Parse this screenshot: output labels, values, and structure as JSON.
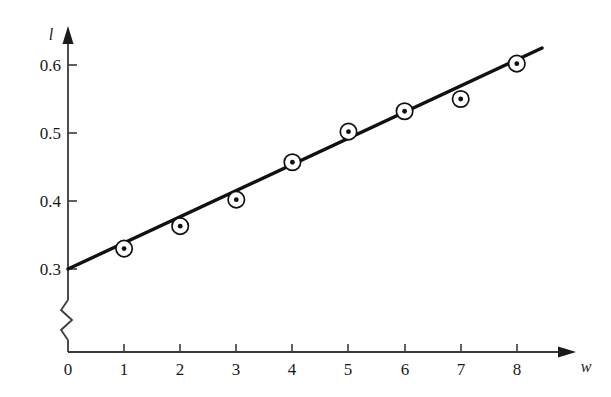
{
  "chart_data": {
    "type": "scatter",
    "title": "",
    "subtitle": "",
    "xlabel": "w",
    "ylabel": "l",
    "x": [
      1,
      2,
      3,
      4,
      5,
      6,
      7,
      8
    ],
    "values": [
      0.33,
      0.363,
      0.402,
      0.457,
      0.502,
      0.532,
      0.55,
      0.602
    ],
    "series": [
      {
        "name": "measured data",
        "marker": "circle-with-center-dot",
        "points": [
          {
            "x": 1,
            "y": 0.33
          },
          {
            "x": 2,
            "y": 0.363
          },
          {
            "x": 3,
            "y": 0.402
          },
          {
            "x": 4,
            "y": 0.457
          },
          {
            "x": 5,
            "y": 0.502
          },
          {
            "x": 6,
            "y": 0.532
          },
          {
            "x": 7,
            "y": 0.55
          },
          {
            "x": 8,
            "y": 0.602
          }
        ]
      },
      {
        "name": "fitted straight line",
        "type": "line",
        "intercept": 0.3,
        "slope": 0.0385,
        "x_start": 0,
        "x_end": 8.45,
        "y_start": 0.3,
        "y_end": 0.625
      }
    ],
    "xticks": [
      0,
      1,
      2,
      3,
      4,
      5,
      6,
      7,
      8
    ],
    "xtick_labels": [
      "0",
      "1",
      "2",
      "3",
      "4",
      "5",
      "6",
      "7",
      "8"
    ],
    "yticks": [
      0.3,
      0.4,
      0.5,
      0.6
    ],
    "ytick_labels": [
      "0.3",
      "0.4",
      "0.5",
      "0.6"
    ],
    "xlim": [
      0,
      8.8
    ],
    "ylim": [
      0.3,
      0.64
    ],
    "grid": false,
    "legend": "none",
    "y_axis_break": true,
    "y_axis_break_note": "zigzag break between 0 and 0.3 on the vertical axis",
    "axis_arrows": true,
    "annotations": []
  },
  "axes": {
    "y_axis_title": "l",
    "x_axis_title": "w",
    "y_tick_labels": [
      "0.6",
      "0.5",
      "0.4",
      "0.3"
    ],
    "x_tick_labels": [
      "0",
      "1",
      "2",
      "3",
      "4",
      "5",
      "6",
      "7",
      "8"
    ]
  },
  "colors": {
    "background": "#ffffff",
    "axis": "#3a3a3a",
    "line": "#111111",
    "marker_stroke": "#111111",
    "marker_fill": "#ffffff",
    "text": "#1a1a1a"
  }
}
